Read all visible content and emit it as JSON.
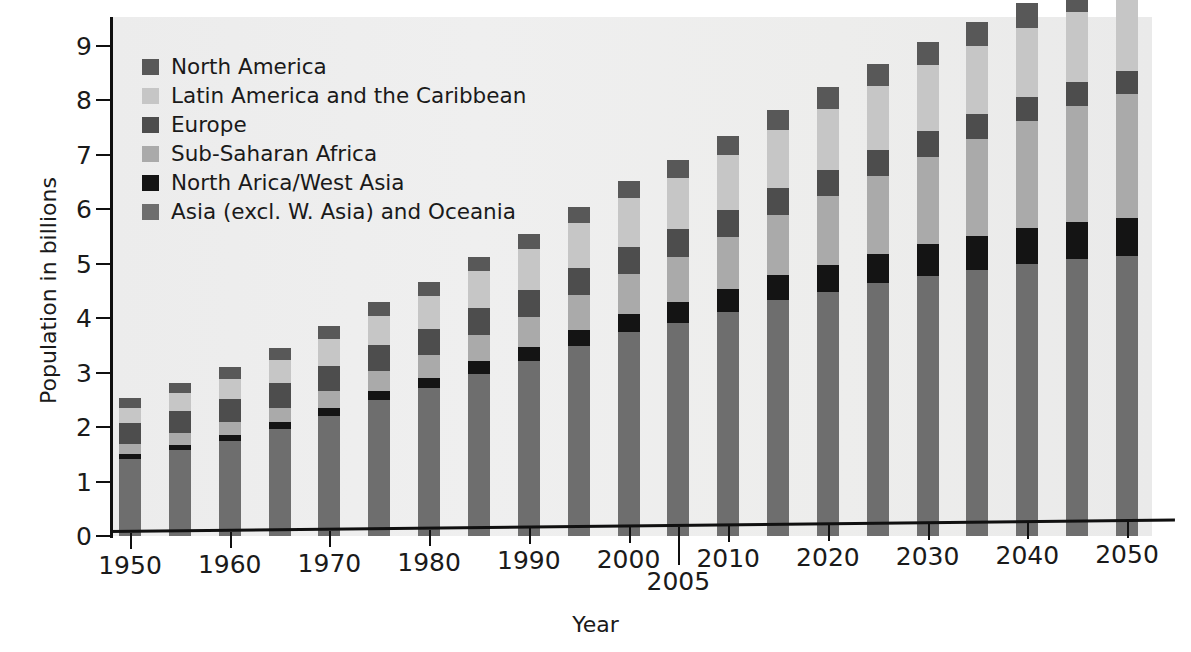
{
  "chart_data": {
    "type": "bar",
    "subtype": "stacked-bar",
    "title": "",
    "xlabel": "Year",
    "ylabel": "Population in billions",
    "ylim": [
      0,
      9
    ],
    "ytick_labels": [
      "0",
      "1",
      "2",
      "3",
      "4",
      "5",
      "6",
      "7",
      "8",
      "9"
    ],
    "yticks": [
      0,
      1,
      2,
      3,
      4,
      5,
      6,
      7,
      8,
      9
    ],
    "grid": false,
    "legend_position": "upper-left-inside",
    "xtick_labels": [
      "1950",
      "1960",
      "1970",
      "1980",
      "1990",
      "2000",
      "2005",
      "2010",
      "2020",
      "2030",
      "2040",
      "2050"
    ],
    "xticks": [
      1950,
      1960,
      1970,
      1980,
      1990,
      2000,
      2005,
      2010,
      2020,
      2030,
      2040,
      2050
    ],
    "categories": [
      1950,
      1955,
      1960,
      1965,
      1970,
      1975,
      1980,
      1985,
      1990,
      1995,
      2000,
      2005,
      2010,
      2015,
      2020,
      2025,
      2030,
      2035,
      2040,
      2045,
      2050
    ],
    "series": [
      {
        "name": "Asia (excl. W. Asia) and Oceania",
        "color": "#6e6e6e",
        "values": [
          1.42,
          1.58,
          1.74,
          1.96,
          2.21,
          2.5,
          2.71,
          2.98,
          3.21,
          3.49,
          3.74,
          3.91,
          4.11,
          4.33,
          4.48,
          4.64,
          4.78,
          4.89,
          5.0,
          5.09,
          5.14
        ]
      },
      {
        "name": "North Arica/West Asia",
        "color": "#141414",
        "values": [
          0.09,
          0.1,
          0.11,
          0.13,
          0.15,
          0.17,
          0.2,
          0.23,
          0.26,
          0.3,
          0.34,
          0.38,
          0.42,
          0.46,
          0.5,
          0.54,
          0.58,
          0.62,
          0.65,
          0.68,
          0.71
        ]
      },
      {
        "name": "Sub-Saharan Africa",
        "color": "#aaaaaa",
        "values": [
          0.18,
          0.21,
          0.24,
          0.27,
          0.31,
          0.36,
          0.41,
          0.48,
          0.55,
          0.64,
          0.73,
          0.84,
          0.96,
          1.1,
          1.26,
          1.43,
          1.61,
          1.79,
          1.97,
          2.13,
          2.27
        ]
      },
      {
        "name": "Europe",
        "color": "#4d4d4d",
        "values": [
          0.39,
          0.41,
          0.43,
          0.45,
          0.46,
          0.48,
          0.48,
          0.49,
          0.5,
          0.5,
          0.5,
          0.5,
          0.5,
          0.5,
          0.49,
          0.48,
          0.47,
          0.46,
          0.45,
          0.44,
          0.43
        ]
      },
      {
        "name": "Latin America and the Caribbean",
        "color": "#c6c6c6",
        "values": [
          0.28,
          0.32,
          0.37,
          0.42,
          0.48,
          0.54,
          0.61,
          0.68,
          0.75,
          0.82,
          0.89,
          0.95,
          1.01,
          1.07,
          1.12,
          1.17,
          1.21,
          1.24,
          1.26,
          1.28,
          1.29
        ]
      },
      {
        "name": "North America",
        "color": "#585858",
        "values": [
          0.17,
          0.19,
          0.21,
          0.22,
          0.24,
          0.25,
          0.26,
          0.27,
          0.28,
          0.3,
          0.32,
          0.33,
          0.35,
          0.37,
          0.39,
          0.41,
          0.43,
          0.45,
          0.46,
          0.48,
          0.49
        ]
      }
    ],
    "totals": [
      2.53,
      2.81,
      3.1,
      3.45,
      3.85,
      4.3,
      4.67,
      5.13,
      5.55,
      6.05,
      6.52,
      6.91,
      7.35,
      7.83,
      8.24,
      8.67,
      9.08,
      9.45,
      9.79,
      10.1,
      10.33
    ]
  },
  "legend": {
    "items": [
      {
        "label": "North America",
        "color": "#585858"
      },
      {
        "label": "Latin America and the Caribbean",
        "color": "#c6c6c6"
      },
      {
        "label": "Europe",
        "color": "#4d4d4d"
      },
      {
        "label": "Sub-Saharan Africa",
        "color": "#aaaaaa"
      },
      {
        "label": "North Arica/West Asia",
        "color": "#141414"
      },
      {
        "label": "Asia (excl. W. Asia) and Oceania",
        "color": "#6e6e6e"
      }
    ]
  },
  "axes": {
    "y_title": "Population in billions",
    "x_title": "Year"
  }
}
